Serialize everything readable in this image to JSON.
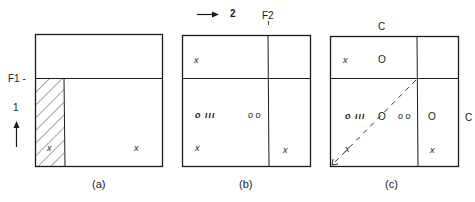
{
  "figure": {
    "panels": [
      {
        "id": "a",
        "caption": "(a)",
        "side_labels": {
          "f1": "F1 -",
          "dimension": "1"
        },
        "cells": {
          "hatched_marker": "x",
          "lower_right_marker": "x"
        }
      },
      {
        "id": "b",
        "caption": "(b)",
        "top_labels": {
          "dimension": "2",
          "f2": "F2"
        },
        "cells": {
          "upper_left_marker": "x",
          "middle_left_cluster": "o ııı",
          "middle_right_pair": "o o",
          "lower_left_marker": "x",
          "lower_right_marker": "x"
        }
      },
      {
        "id": "c",
        "caption": "(c)",
        "top_label": "C",
        "right_label": "C",
        "cells": {
          "upper_left_marker": "x",
          "upper_center_circle": "O",
          "middle_left_cluster": "o ııı",
          "middle_center_circle": "O",
          "middle_right_pair": "o o",
          "middle_right_column_circle": "O",
          "lower_left_marker": "x",
          "lower_right_marker": "x"
        }
      }
    ],
    "colors": {
      "ink": "#1a1a1a",
      "background": "#ffffff"
    }
  }
}
